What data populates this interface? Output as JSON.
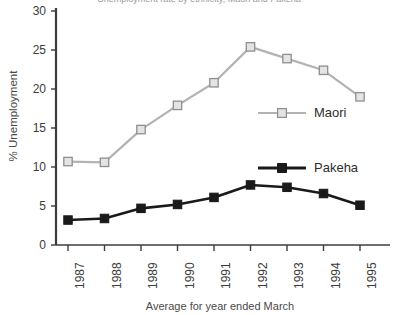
{
  "chart_data": {
    "type": "line",
    "title": "Unemployment rate by ethnicity, Maori and Pakeha",
    "xlabel": "Average for year ended March",
    "ylabel": "% Unemployment",
    "categories": [
      "1987",
      "1988",
      "1989",
      "1990",
      "1991",
      "1992",
      "1993",
      "1994",
      "1995"
    ],
    "series": [
      {
        "name": "Maori",
        "color": "#b3b3b3",
        "marker": "open-square",
        "values": [
          10.7,
          10.6,
          14.8,
          17.9,
          20.8,
          25.4,
          23.9,
          22.4,
          19.0
        ]
      },
      {
        "name": "Pakeha",
        "color": "#1a1a1a",
        "marker": "filled-square",
        "values": [
          3.2,
          3.4,
          4.7,
          5.2,
          6.1,
          7.7,
          7.4,
          6.6,
          5.1
        ]
      }
    ],
    "ylim": [
      0,
      30
    ],
    "yticks": [
      0,
      5,
      10,
      15,
      20,
      25,
      30
    ],
    "grid": false,
    "legend_position": "inside-right"
  },
  "axis": {
    "y_tick_labels": [
      "30",
      "25",
      "20",
      "15",
      "10",
      "5",
      "0"
    ],
    "x_tick_labels": [
      "1987",
      "1988",
      "1989",
      "1990",
      "1991",
      "1992",
      "1993",
      "1994",
      "1995"
    ]
  },
  "legend": {
    "entries": [
      {
        "label": "Maori"
      },
      {
        "label": "Pakeha"
      }
    ]
  },
  "colors": {
    "maori": "#b3b3b3",
    "pakeha": "#1a1a1a",
    "axis": "#3c3c3c",
    "text": "#3a3a3a",
    "background": "#ffffff"
  }
}
